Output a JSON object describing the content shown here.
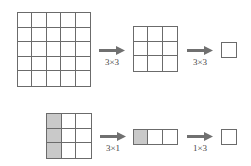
{
  "colors": {
    "line": "#6b6b6b",
    "shade": "#c9c9c9",
    "arrow": "#707070",
    "background": "#ffffff"
  },
  "top_row": {
    "input_grid": {
      "rows": 5,
      "cols": 5,
      "shaded_cells": []
    },
    "arrow_1": {
      "label": "3×3"
    },
    "middle_grid": {
      "rows": 3,
      "cols": 3,
      "shaded_cells": []
    },
    "arrow_2": {
      "label": "3×3"
    },
    "output_grid": {
      "rows": 1,
      "cols": 1,
      "shaded_cells": []
    }
  },
  "bottom_row": {
    "input_grid": {
      "rows": 3,
      "cols": 3,
      "shaded_cells": [
        [
          0,
          0
        ],
        [
          1,
          0
        ],
        [
          2,
          0
        ]
      ]
    },
    "arrow_1": {
      "label": "3×1"
    },
    "middle_grid": {
      "rows": 1,
      "cols": 3,
      "shaded_cells": [
        [
          0,
          0
        ]
      ]
    },
    "arrow_2": {
      "label": "1×3"
    },
    "output_grid": {
      "rows": 1,
      "cols": 1,
      "shaded_cells": []
    }
  }
}
